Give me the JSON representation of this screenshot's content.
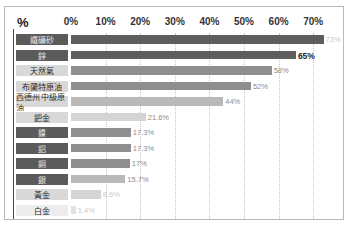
{
  "chart": {
    "title": "",
    "percent_symbol": "%"
  },
  "chart_data": {
    "type": "bar",
    "orientation": "horizontal",
    "title": "",
    "xlabel": "%",
    "ylabel": "",
    "xlim": [
      0,
      75
    ],
    "grid": true,
    "legend": false,
    "tick_labels": [
      "0%",
      "10%",
      "20%",
      "30%",
      "40%",
      "50%",
      "60%",
      "70%"
    ],
    "ticks": [
      0,
      10,
      20,
      30,
      40,
      50,
      60,
      70
    ],
    "categories": [
      "鐵礦砂",
      "鋅",
      "天然氣",
      "布蘭特原油",
      "西德州中級原油",
      "鈀金",
      "鎳",
      "鋁",
      "銅",
      "銀",
      "黃金",
      "白金"
    ],
    "values": [
      73,
      65,
      58,
      52,
      44,
      21.6,
      17.3,
      17.3,
      17,
      15.7,
      8.6,
      1.4
    ],
    "value_labels": [
      "73%",
      "65%",
      "58%",
      "52%",
      "44%",
      "21.6%",
      "17.3%",
      "17.3%",
      "17%",
      "15.7%",
      "8.6%",
      "1.4%"
    ],
    "bar_tones": [
      "dark",
      "dark",
      "mid",
      "mid",
      "light",
      "pale",
      "mid",
      "mid",
      "mid",
      "light",
      "pale",
      "faint"
    ],
    "label_tones": [
      "dark",
      "dark",
      "light",
      "light",
      "light",
      "light",
      "dark",
      "dark",
      "dark",
      "dark",
      "light",
      "pale"
    ],
    "value_tones": [
      "faint",
      "strong",
      "normal",
      "normal",
      "normal",
      "normal",
      "normal",
      "normal",
      "normal",
      "normal",
      "faint",
      "faint"
    ]
  },
  "colors": {
    "frame": "#b9b9b9",
    "axis": "#4a4a4a",
    "grid": "#c4c4c4",
    "bar_dark": "#5e5e5e",
    "bar_mid": "#8f8f8f",
    "bar_light": "#b9b9b9",
    "background": "#ffffff"
  }
}
